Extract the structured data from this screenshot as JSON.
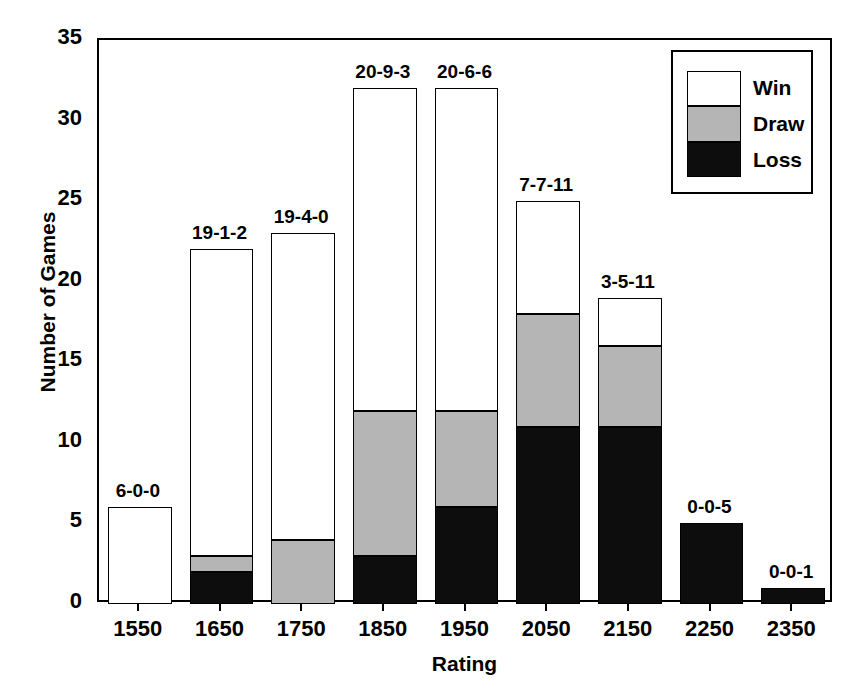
{
  "chart_data": {
    "type": "bar",
    "subtype": "stacked-vertical",
    "title": "",
    "xlabel": "Rating",
    "ylabel": "Number of Games",
    "categories": [
      "1550",
      "1650",
      "1750",
      "1850",
      "1950",
      "2050",
      "2150",
      "2250",
      "2350"
    ],
    "series": [
      {
        "name": "Win",
        "color": "#ffffff",
        "values": [
          6,
          19,
          19,
          20,
          20,
          7,
          3,
          0,
          0
        ]
      },
      {
        "name": "Draw",
        "color": "#b5b5b5",
        "values": [
          0,
          1,
          4,
          9,
          6,
          7,
          5,
          0,
          0
        ]
      },
      {
        "name": "Loss",
        "color": "#0d0d0d",
        "values": [
          0,
          2,
          0,
          3,
          6,
          11,
          11,
          5,
          1
        ]
      }
    ],
    "stack_order_bottom_to_top": [
      "Loss",
      "Draw",
      "Win"
    ],
    "totals": [
      6,
      22,
      23,
      32,
      32,
      25,
      19,
      5,
      1
    ],
    "bar_labels": [
      "6-0-0",
      "19-1-2",
      "19-4-0",
      "20-9-3",
      "20-6-6",
      "7-7-11",
      "3-5-11",
      "0-0-5",
      "0-0-1"
    ],
    "bar_label_format": "Win-Draw-Loss",
    "ylim": [
      0,
      35
    ],
    "yticks": [
      0,
      5,
      10,
      15,
      20,
      25,
      30,
      35
    ],
    "ytick_labels": [
      "0",
      "5",
      "10",
      "15",
      "20",
      "25",
      "30",
      "35"
    ],
    "grid": false,
    "legend": {
      "position": "top-right",
      "entries": [
        {
          "label": "Win",
          "color": "#ffffff"
        },
        {
          "label": "Draw",
          "color": "#b5b5b5"
        },
        {
          "label": "Loss",
          "color": "#0d0d0d"
        }
      ]
    }
  }
}
